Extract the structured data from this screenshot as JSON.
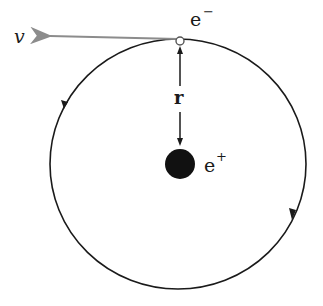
{
  "diagram": {
    "labels": {
      "velocity": "v",
      "electron": "e",
      "electron_sup": "−",
      "radius": "r",
      "positron": "e",
      "positron_sup": "+"
    },
    "colors": {
      "orbit": "#1a1a1a",
      "velocity_arrow": "#8c8c8c",
      "nucleus": "#111111",
      "background": "#ffffff"
    },
    "orbit": {
      "cx": 178,
      "cy": 164,
      "rx": 128,
      "ry": 125,
      "direction": "counterclockwise"
    }
  }
}
